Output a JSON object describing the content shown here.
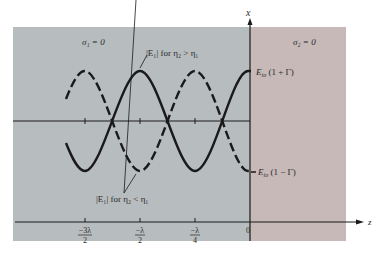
{
  "colors": {
    "region1_bg": "#b7bcbe",
    "region2_bg": "#c6b9b8",
    "line": "#1a1a1a",
    "background": "#ffffff"
  },
  "axes": {
    "vertical_label": "x",
    "horizontal_label": "z",
    "origin_label": "0",
    "ticks": [
      {
        "num": "−3λ",
        "den": "2",
        "position": "-3λ/2"
      },
      {
        "num": "−λ",
        "den": "2",
        "position": "-λ/2"
      },
      {
        "num": "−λ",
        "den": "4",
        "position": "-λ/4"
      }
    ]
  },
  "regions": {
    "left": {
      "sigma_label": "σ₁ = 0"
    },
    "right": {
      "sigma_label": "σ₂ = 0"
    }
  },
  "curves": {
    "solid": {
      "label": "|E₁| for η₂ > η₁",
      "style": "solid"
    },
    "dashed": {
      "label": "|E₁| for η₂ < η₁",
      "style": "dashed"
    }
  },
  "annotations": {
    "max_label": "E_io (1 + Γ)",
    "max_main": "E",
    "max_sub": "io",
    "max_rest": " (1 + Γ)",
    "min_label": "E_io (1 − Γ)",
    "min_main": "E",
    "min_sub": "io",
    "min_rest": " (1 − Γ)"
  }
}
